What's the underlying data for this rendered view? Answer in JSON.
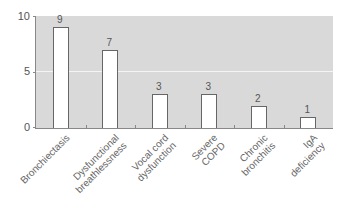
{
  "chart_data": {
    "type": "bar",
    "title": "",
    "xlabel": "",
    "ylabel": "",
    "ylim": [
      0,
      10
    ],
    "yticks": [
      "0",
      "5",
      "10"
    ],
    "grid": true,
    "categories": [
      "Bronchiectasis",
      "Dysfunctional breathlessness",
      "Vocal cord dysfunction",
      "Severe COPD",
      "Chronic bronchitis",
      "IgA deficiency"
    ],
    "category_lines": [
      [
        "Bronchiectasis"
      ],
      [
        "Dysfunctional",
        "breathlessness"
      ],
      [
        "Vocal cord",
        "dysfunction"
      ],
      [
        "Severe",
        "COPD"
      ],
      [
        "Chronic",
        "bronchitis"
      ],
      [
        "IgA",
        "deficiency"
      ]
    ],
    "values": [
      9,
      7,
      3,
      3,
      2,
      1
    ],
    "value_labels": [
      "9",
      "7",
      "3",
      "3",
      "2",
      "1"
    ],
    "legend": null
  },
  "colors": {
    "plot_bg": "#d9d9d9",
    "bar_fill": "#ffffff",
    "bar_edge": "#666666",
    "gridline": "#f4f4f4"
  }
}
